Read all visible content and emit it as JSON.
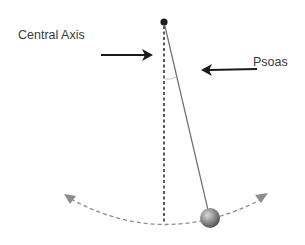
{
  "diagram": {
    "labels": {
      "central_axis": "Central Axis",
      "psoas": "Psoas"
    },
    "elements": {
      "pivot": "pivot-point",
      "central_axis_line": "dashed vertical reference line",
      "pendulum_rod": "solid rod from pivot to bob",
      "bob": "pendulum weight (sphere)",
      "swing_arc": "dashed arc with arrowheads on both ends",
      "angle_marker": "small arc indicating deviation angle"
    },
    "arrows": [
      {
        "name": "central-axis-arrow",
        "direction": "right",
        "points_to": "central axis"
      },
      {
        "name": "psoas-arrow",
        "direction": "left",
        "points_to": "pendulum rod"
      }
    ],
    "colors": {
      "text": "#3a3a3a",
      "arrow": "#1a1a1a",
      "rod": "#6e6e6e",
      "axis": "#333333",
      "arc": "#8c8c8c",
      "bob": "#8a8a8a"
    }
  }
}
